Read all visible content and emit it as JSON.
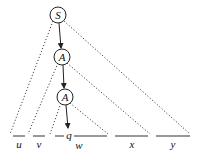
{
  "diagram": {
    "type": "parse-tree-pumping",
    "nodes": [
      {
        "id": "S",
        "label": "S"
      },
      {
        "id": "A1",
        "label": "A"
      },
      {
        "id": "A2",
        "label": "A"
      }
    ],
    "edges": [
      {
        "from": "S",
        "to": "A1",
        "style": "arrow"
      },
      {
        "from": "A1",
        "to": "A2",
        "style": "arrow"
      },
      {
        "from": "A2",
        "to": "q",
        "style": "arrow"
      }
    ],
    "terminal_label": "q",
    "segments": [
      {
        "id": "u",
        "label": "u"
      },
      {
        "id": "v",
        "label": "v"
      },
      {
        "id": "w",
        "label": "w"
      },
      {
        "id": "x",
        "label": "x"
      },
      {
        "id": "y",
        "label": "y"
      }
    ],
    "subtrees": [
      {
        "root": "S",
        "spans": [
          "u",
          "v",
          "w",
          "x",
          "y"
        ]
      },
      {
        "root": "A1",
        "spans": [
          "v",
          "w",
          "x"
        ]
      },
      {
        "root": "A2",
        "spans": [
          "w"
        ]
      }
    ]
  }
}
